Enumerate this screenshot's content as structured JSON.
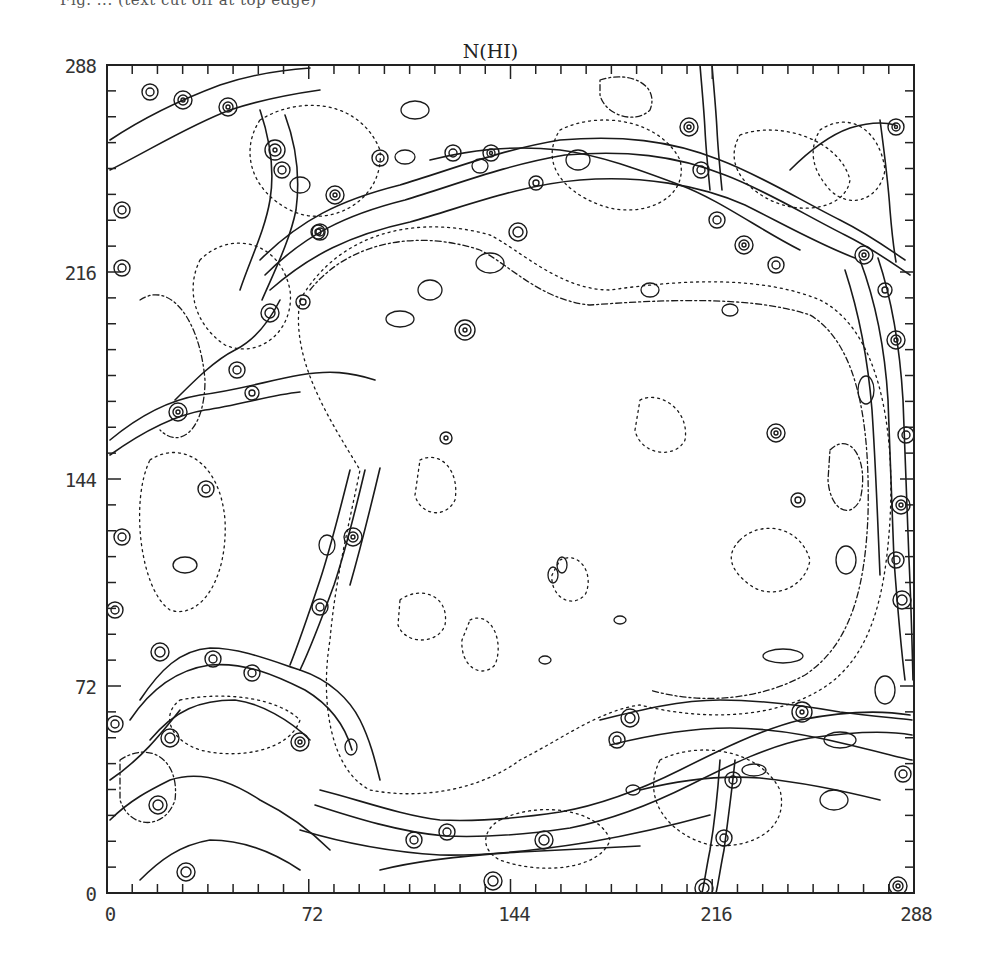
{
  "page": {
    "caption_fragment": "Fig. ... (text cut off at top edge)"
  },
  "chart_data": {
    "type": "contour",
    "title": "N(HI)",
    "xlabel": "",
    "ylabel": "",
    "xlim": [
      0,
      288
    ],
    "ylim": [
      0,
      288
    ],
    "x_ticks": [
      0,
      72,
      144,
      216,
      288
    ],
    "y_ticks": [
      0,
      72,
      144,
      216,
      288
    ],
    "x_tick_labels": [
      "0",
      "72",
      "144",
      "216",
      "288"
    ],
    "y_tick_labels": [
      "0",
      "72",
      "144",
      "216",
      "288"
    ],
    "minor_tick_spacing": 9,
    "grid": false,
    "legend": null,
    "line_styles": [
      "solid (higher column density levels)",
      "dotted/dashed (low column density levels)"
    ],
    "features": [
      {
        "name": "central cavity",
        "x_range": [
          75,
          275
        ],
        "y_range": [
          25,
          225
        ]
      },
      {
        "name": "upper shell filament",
        "x_range": [
          120,
          270
        ],
        "y_range": [
          205,
          250
        ]
      },
      {
        "name": "right shell filament",
        "x_range": [
          265,
          288
        ],
        "y_range": [
          60,
          220
        ]
      },
      {
        "name": "lower shell filament",
        "x_range": [
          60,
          200
        ],
        "y_range": [
          10,
          40
        ]
      },
      {
        "name": "diagonal left filament",
        "x_range": [
          30,
          90
        ],
        "y_range": [
          95,
          175
        ]
      },
      {
        "name": "lower-left shell",
        "x_range": [
          10,
          70
        ],
        "y_range": [
          40,
          90
        ]
      }
    ]
  },
  "colors": {
    "background": "#ffffff",
    "contour": "#1a1a1a",
    "frame": "#222222"
  }
}
